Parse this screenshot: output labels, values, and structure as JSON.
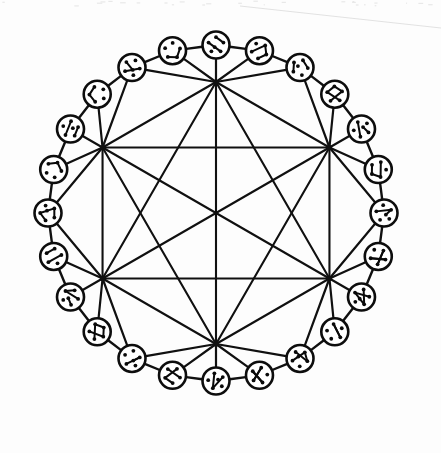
{
  "figure": {
    "background_color": "#fdfdfd",
    "ink_color": "#101010",
    "canvas": {
      "width": 441,
      "height": 453
    },
    "geometry": {
      "center_x": 216,
      "center_y": 213,
      "ring_radius": 168,
      "hub_radius": 131,
      "node_glyph_radius": 13.5,
      "node_glyph_stroke": 2.6,
      "hub_count": 6,
      "ring_node_count": 24,
      "nodes_between_hubs": 4
    },
    "hubs": [
      {
        "id": "H0",
        "label": "top",
        "x": 216,
        "y": 85,
        "degree": 12
      },
      {
        "id": "H1",
        "label": "right",
        "x": 345,
        "y": 182,
        "degree": 12
      },
      {
        "id": "H2",
        "label": "bottom-right",
        "x": 297,
        "y": 339,
        "degree": 12
      },
      {
        "id": "H3",
        "label": "bottom-left",
        "x": 135,
        "y": 339,
        "degree": 12
      },
      {
        "id": "H4",
        "label": "left",
        "x": 87,
        "y": 182,
        "degree": 12
      }
    ],
    "chords": {
      "type": "complete-graph",
      "on_vertices": 6,
      "edge_count": 15,
      "note": "every hub joined to every other hub"
    },
    "ring_nodes": [
      {
        "index": 0,
        "angle_deg": -90,
        "dots": 6,
        "inner_edges": 2
      },
      {
        "index": 1,
        "angle_deg": -75,
        "dots": 5,
        "inner_edges": 3
      },
      {
        "index": 2,
        "angle_deg": -60,
        "dots": 6,
        "inner_edges": 2
      },
      {
        "index": 3,
        "angle_deg": -45,
        "dots": 5,
        "inner_edges": 4
      },
      {
        "index": 4,
        "angle_deg": -30,
        "dots": 6,
        "inner_edges": 2
      },
      {
        "index": 5,
        "angle_deg": -15,
        "dots": 5,
        "inner_edges": 3
      },
      {
        "index": 6,
        "angle_deg": 0,
        "dots": 6,
        "inner_edges": 2
      },
      {
        "index": 7,
        "angle_deg": 15,
        "dots": 5,
        "inner_edges": 4
      },
      {
        "index": 8,
        "angle_deg": 30,
        "dots": 6,
        "inner_edges": 3
      },
      {
        "index": 9,
        "angle_deg": 45,
        "dots": 5,
        "inner_edges": 2
      },
      {
        "index": 10,
        "angle_deg": 60,
        "dots": 6,
        "inner_edges": 3
      },
      {
        "index": 11,
        "angle_deg": 75,
        "dots": 5,
        "inner_edges": 4
      },
      {
        "index": 12,
        "angle_deg": 90,
        "dots": 6,
        "inner_edges": 2
      },
      {
        "index": 13,
        "angle_deg": 105,
        "dots": 5,
        "inner_edges": 3
      },
      {
        "index": 14,
        "angle_deg": 120,
        "dots": 6,
        "inner_edges": 2
      },
      {
        "index": 15,
        "angle_deg": 135,
        "dots": 5,
        "inner_edges": 4
      },
      {
        "index": 16,
        "angle_deg": 150,
        "dots": 6,
        "inner_edges": 3
      },
      {
        "index": 17,
        "angle_deg": 165,
        "dots": 5,
        "inner_edges": 2
      },
      {
        "index": 18,
        "angle_deg": 180,
        "dots": 6,
        "inner_edges": 3
      },
      {
        "index": 19,
        "angle_deg": 195,
        "dots": 5,
        "inner_edges": 4
      },
      {
        "index": 20,
        "angle_deg": 210,
        "dots": 6,
        "inner_edges": 2
      },
      {
        "index": 21,
        "angle_deg": 225,
        "dots": 5,
        "inner_edges": 3
      },
      {
        "index": 22,
        "angle_deg": 240,
        "dots": 6,
        "inner_edges": 2
      },
      {
        "index": 23,
        "angle_deg": 255,
        "dots": 5,
        "inner_edges": 3
      }
    ],
    "artifact": {
      "present": true,
      "kind": "scanner-streak",
      "color": "#e2e2e2",
      "from_x": 240,
      "from_y": 6,
      "to_x": 441,
      "to_y": 28
    }
  }
}
